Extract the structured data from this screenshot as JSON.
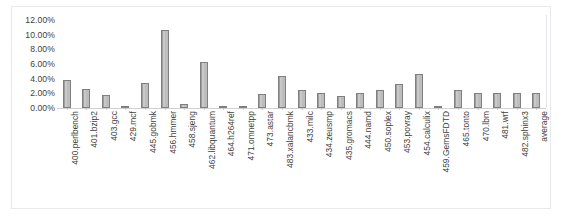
{
  "chart_data": {
    "type": "bar",
    "title": "",
    "xlabel": "",
    "ylabel": "",
    "ylim": [
      0,
      12
    ],
    "yticks": [
      0,
      2,
      4,
      6,
      8,
      10,
      12
    ],
    "ytick_labels": [
      "0.00%",
      "2.00%",
      "4.00%",
      "6.00%",
      "8.00%",
      "10.00%",
      "12.00%"
    ],
    "grid": false,
    "legend": "none",
    "value_format": "percent",
    "bar_fill_color": "#bfbfbf",
    "bar_edge_color": "#808080",
    "axis_color": "#d0d1d4",
    "frame_color": "#e8e9ec",
    "text_color": "#404040",
    "categories": [
      "400.perlbench",
      "401.bzip2",
      "403.gcc",
      "429.mcf",
      "445.gobmk",
      "456.hmmer",
      "458.sjeng",
      "462.libquantum",
      "464.h264ref",
      "471.omnetpp",
      "473.astar",
      "483.xalancbmk",
      "433.milc",
      "434.zeusmp",
      "435.gromacs",
      "444.namd",
      "450.soplex",
      "453.povray",
      "454.calculix",
      "459.GemsFDTD",
      "465.tonto",
      "470.lbm",
      "481.wrf",
      "482.sphinx3",
      "average"
    ],
    "values": [
      3.8,
      2.6,
      1.8,
      0.15,
      3.4,
      10.6,
      0.5,
      6.3,
      0.2,
      0.15,
      1.9,
      4.4,
      2.4,
      2.0,
      1.6,
      2.1,
      2.5,
      3.3,
      4.6,
      0.2,
      2.4,
      2.0,
      2.0,
      2.0,
      2.0
    ]
  }
}
